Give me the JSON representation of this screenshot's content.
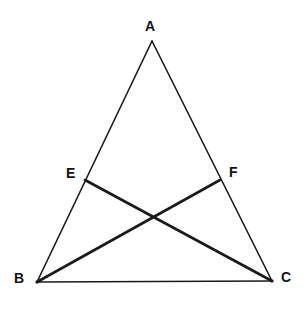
{
  "figure": {
    "background_color": "#ffffff",
    "stroke_color": "#1a1a1a",
    "label_color": "#141414",
    "canvas": {
      "width": 307,
      "height": 311
    },
    "points": {
      "A": {
        "label": "A",
        "x": 152,
        "y": 41
      },
      "B": {
        "label": "B",
        "x": 37,
        "y": 282
      },
      "C": {
        "label": "C",
        "x": 272,
        "y": 281
      },
      "E": {
        "label": "E",
        "x": 85,
        "y": 180
      },
      "F": {
        "label": "F",
        "x": 220,
        "y": 180
      }
    },
    "segments": [
      {
        "name": "side-AB",
        "from": "A",
        "to": "B",
        "weight": 1.6,
        "style": "thin"
      },
      {
        "name": "side-AC",
        "from": "A",
        "to": "C",
        "weight": 1.6,
        "style": "thin"
      },
      {
        "name": "side-BC",
        "from": "B",
        "to": "C",
        "weight": 1.6,
        "style": "thin"
      },
      {
        "name": "cevian-BF",
        "from": "B",
        "to": "F",
        "weight": 2.6,
        "style": "thick"
      },
      {
        "name": "cevian-CE",
        "from": "C",
        "to": "E",
        "weight": 2.6,
        "style": "thick"
      }
    ],
    "intersection": {
      "name": "cevian-intersection",
      "x": 153,
      "y": 217
    }
  }
}
